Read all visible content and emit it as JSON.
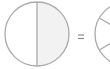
{
  "diagram": {
    "left_circle": {
      "parts": 2,
      "shaded_parts": 1,
      "shade_color": "#f2f2f2"
    },
    "operator": "=",
    "right_circle": {
      "parts": 6,
      "partially_visible": true
    },
    "stroke_color": "#aaaaaa"
  }
}
